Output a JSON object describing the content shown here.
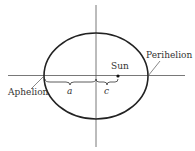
{
  "diagram": {
    "type": "orbital-ellipse",
    "labels": {
      "aphelion": "Aphelion",
      "perihelion": "Perihelion",
      "sun": "Sun",
      "semi_major": "a",
      "focal_distance": "c"
    },
    "colors": {
      "stroke": "#222222",
      "axis": "#555555",
      "text": "#333333"
    }
  }
}
